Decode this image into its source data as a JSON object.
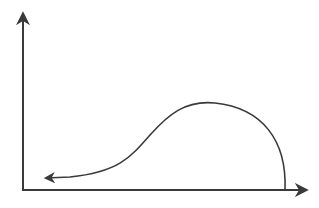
{
  "diagram": {
    "type": "axes-with-curve",
    "background": "#ffffff",
    "stroke_color": "#3a3a3a",
    "axes": {
      "y_axis": {
        "x": 23,
        "y_start": 191,
        "y_end": 12,
        "arrow": "up"
      },
      "x_axis": {
        "y": 190,
        "x_start": 22,
        "x_end": 308,
        "arrow": "right"
      }
    },
    "curve": {
      "description": "Curve starting at the x-axis on the right, rising into a rounded hump, then descending leftward to an arrowhead near the origin",
      "path": "M 285 190 C 287 140, 262 108, 215 103 C 185 100, 168 115, 150 135 C 130 158, 118 172, 70 177 L 44 178",
      "arrow_end": "left"
    }
  }
}
